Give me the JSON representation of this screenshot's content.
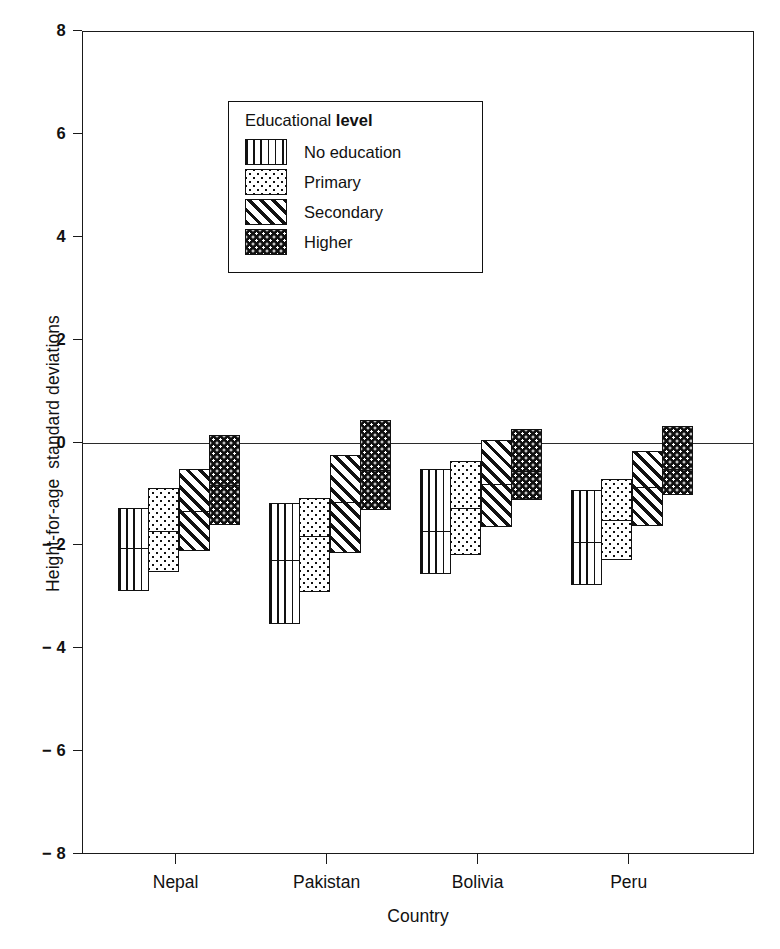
{
  "chart_data": {
    "type": "bar",
    "subtype": "box-range-chart",
    "title": "",
    "xlabel": "Country",
    "ylabel": "Height-for-age  standard deviations",
    "categories": [
      "Nepal",
      "Pakistan",
      "Bolivia",
      "Peru"
    ],
    "ylim": [
      -8,
      8
    ],
    "yticks": [
      8,
      6,
      4,
      2,
      0,
      -2,
      -4,
      -6,
      -8
    ],
    "ytick_labels": [
      "8",
      "6",
      "4",
      "2",
      "0",
      "− 2",
      "− 4",
      "− 6",
      "− 8"
    ],
    "grid": false,
    "reference_line": 0,
    "legend": {
      "title_prefix": "Educational ",
      "title_emphasis": "level",
      "position": "upper-left-inset",
      "entries": [
        {
          "label": "No education",
          "fill": "fill-vertical"
        },
        {
          "label": "Primary",
          "fill": "fill-dots-light"
        },
        {
          "label": "Secondary",
          "fill": "fill-diagonal"
        },
        {
          "label": "Higher",
          "fill": "fill-dots-dark"
        }
      ]
    },
    "series": [
      {
        "name": "No education",
        "fill": "fill-vertical",
        "values": [
          {
            "category": "Nepal",
            "upper": -1.27,
            "median": -2.06,
            "lower": -2.88
          },
          {
            "category": "Pakistan",
            "upper": -1.18,
            "median": -2.3,
            "lower": -3.52
          },
          {
            "category": "Bolivia",
            "upper": -0.52,
            "median": -1.74,
            "lower": -2.56
          },
          {
            "category": "Peru",
            "upper": -0.93,
            "median": -1.94,
            "lower": -2.78
          }
        ]
      },
      {
        "name": "Primary",
        "fill": "fill-dots-light",
        "values": [
          {
            "category": "Nepal",
            "upper": -0.89,
            "median": -1.74,
            "lower": -2.52
          },
          {
            "category": "Pakistan",
            "upper": -1.08,
            "median": -1.82,
            "lower": -2.9
          },
          {
            "category": "Bolivia",
            "upper": -0.36,
            "median": -1.28,
            "lower": -2.18
          },
          {
            "category": "Peru",
            "upper": -0.7,
            "median": -1.52,
            "lower": -2.28
          }
        ]
      },
      {
        "name": "Secondary",
        "fill": "fill-diagonal",
        "values": [
          {
            "category": "Nepal",
            "upper": -0.52,
            "median": -1.34,
            "lower": -2.1
          },
          {
            "category": "Pakistan",
            "upper": -0.24,
            "median": -1.16,
            "lower": -2.14
          },
          {
            "category": "Bolivia",
            "upper": 0.04,
            "median": -0.82,
            "lower": -1.64
          },
          {
            "category": "Peru",
            "upper": -0.16,
            "median": -0.88,
            "lower": -1.62
          }
        ]
      },
      {
        "name": "Higher",
        "fill": "fill-dots-dark",
        "values": [
          {
            "category": "Nepal",
            "upper": 0.15,
            "median": -0.84,
            "lower": -1.6
          },
          {
            "category": "Pakistan",
            "upper": 0.44,
            "median": -0.54,
            "lower": -1.32
          },
          {
            "category": "Bolivia",
            "upper": 0.27,
            "median": -0.56,
            "lower": -1.12
          },
          {
            "category": "Peru",
            "upper": 0.32,
            "median": -0.52,
            "lower": -1.02
          }
        ]
      }
    ]
  },
  "axes": {
    "x_title": "Country",
    "y_title": "Height-for-age  standard deviations"
  }
}
